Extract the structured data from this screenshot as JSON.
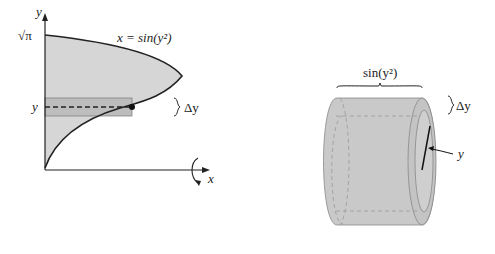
{
  "left_figure": {
    "y_axis_label": "y",
    "x_axis_label": "x",
    "y_top_tick": "√π",
    "y_slice_tick": "y",
    "curve_label": "x = sin(y²)",
    "delta_label": "Δy",
    "fill_color": "#d4d4d4",
    "slice_color": "#b8b8b8"
  },
  "right_figure": {
    "width_label": "sin(y²)",
    "delta_label": "Δy",
    "radius_label": "y",
    "shell_color": "#c9c9c9"
  }
}
